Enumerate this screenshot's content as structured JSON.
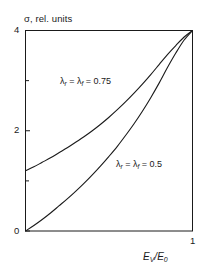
{
  "chart_data": {
    "type": "line",
    "title": "",
    "subtitle": "",
    "ylabel": "σ, rel. units",
    "xlabel": "E_V/E_0",
    "xlabel_parts": {
      "e1": "E",
      "sub1": "V",
      "slash": "/",
      "e2": "E",
      "sub2": "0"
    },
    "xlim": [
      0,
      1
    ],
    "ylim": [
      0,
      4
    ],
    "grid": false,
    "legend": "inline-annotations",
    "x_ticks": [
      0,
      1
    ],
    "x_tick_labels": [
      "",
      "1"
    ],
    "y_ticks": [
      0,
      1,
      2,
      3,
      4
    ],
    "y_tick_labels": [
      "0",
      "",
      "2",
      "",
      "4"
    ],
    "y_minor_ticks": [
      1,
      3
    ],
    "series": [
      {
        "name": "lambda_r = lambda_f = 0.75",
        "label": "λ_r = λ_f = 0.75",
        "label_parts": {
          "lam1": "λ",
          "sub1": "r",
          "eq1": " = ",
          "lam2": "λ",
          "sub2": "f",
          "eq2": " = ",
          "value": "0.75"
        },
        "color": "#1a1a1a",
        "x": [
          0.0,
          0.05,
          0.1,
          0.15,
          0.2,
          0.25,
          0.3,
          0.35,
          0.4,
          0.45,
          0.5,
          0.55,
          0.6,
          0.65,
          0.7,
          0.75,
          0.8,
          0.85,
          0.9,
          0.95,
          1.0
        ],
        "y": [
          1.2,
          1.28,
          1.37,
          1.46,
          1.56,
          1.66,
          1.77,
          1.88,
          2.0,
          2.13,
          2.27,
          2.42,
          2.58,
          2.75,
          2.93,
          3.12,
          3.32,
          3.52,
          3.7,
          3.87,
          4.0
        ]
      },
      {
        "name": "lambda_r = lambda_f = 0.5",
        "label": "λ_r = λ_f = 0.5",
        "label_parts": {
          "lam1": "λ",
          "sub1": "r",
          "eq1": " = ",
          "lam2": "λ",
          "sub2": "f",
          "eq2": " = ",
          "value": "0.5"
        },
        "color": "#1a1a1a",
        "x": [
          0.0,
          0.05,
          0.1,
          0.15,
          0.2,
          0.25,
          0.3,
          0.35,
          0.4,
          0.45,
          0.5,
          0.55,
          0.6,
          0.65,
          0.7,
          0.75,
          0.8,
          0.85,
          0.9,
          0.95,
          1.0
        ],
        "y": [
          0.0,
          0.11,
          0.23,
          0.36,
          0.5,
          0.64,
          0.79,
          0.95,
          1.12,
          1.3,
          1.49,
          1.69,
          1.91,
          2.14,
          2.39,
          2.66,
          2.95,
          3.26,
          3.55,
          3.81,
          4.0
        ]
      }
    ],
    "axis_color": "#1a1a1a",
    "background": "#ffffff"
  },
  "axis": {
    "y_title": "σ, rel. units",
    "y_tick_4": "4",
    "y_tick_2": "2",
    "y_tick_0": "0",
    "x_tick_1": "1"
  }
}
